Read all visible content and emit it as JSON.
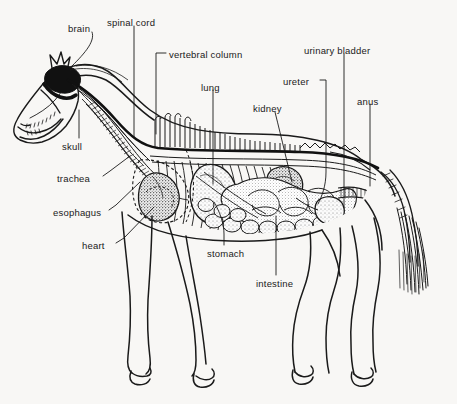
{
  "figure": {
    "kind": "anatomical-diagram",
    "background_color": "#f8f7f5",
    "ink_color": "#1a1a1a"
  },
  "labels": [
    {
      "id": "brain",
      "text": "brain",
      "x": 68,
      "y": 24,
      "anchor": "start"
    },
    {
      "id": "spinal-cord",
      "text": "spinal cord",
      "x": 107,
      "y": 18,
      "anchor": "start"
    },
    {
      "id": "vertebral-column",
      "text": "vertebral column",
      "x": 169,
      "y": 50,
      "anchor": "start"
    },
    {
      "id": "urinary-bladder",
      "text": "urinary bladder",
      "x": 304,
      "y": 46,
      "anchor": "start"
    },
    {
      "id": "ureter",
      "text": "ureter",
      "x": 283,
      "y": 77,
      "anchor": "start"
    },
    {
      "id": "lung",
      "text": "lung",
      "x": 201,
      "y": 83,
      "anchor": "start"
    },
    {
      "id": "kidney",
      "text": "kidney",
      "x": 253,
      "y": 104,
      "anchor": "start"
    },
    {
      "id": "anus",
      "text": "anus",
      "x": 357,
      "y": 97,
      "anchor": "start"
    },
    {
      "id": "skull",
      "text": "skull",
      "x": 62,
      "y": 142,
      "anchor": "start"
    },
    {
      "id": "trachea",
      "text": "trachea",
      "x": 57,
      "y": 174,
      "anchor": "start"
    },
    {
      "id": "esophagus",
      "text": "esophagus",
      "x": 53,
      "y": 208,
      "anchor": "start"
    },
    {
      "id": "heart",
      "text": "heart",
      "x": 82,
      "y": 241,
      "anchor": "start"
    },
    {
      "id": "stomach",
      "text": "stomach",
      "x": 207,
      "y": 249,
      "anchor": "start"
    },
    {
      "id": "intestine",
      "text": "intestine",
      "x": 256,
      "y": 279,
      "anchor": "start"
    }
  ]
}
